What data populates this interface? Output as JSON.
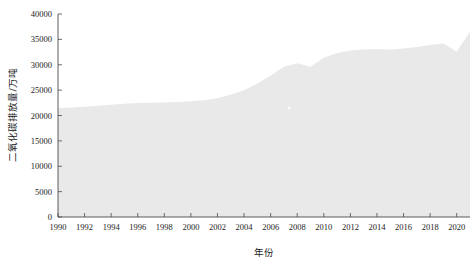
{
  "chart_data": {
    "type": "area",
    "title": "",
    "subtitle": "",
    "xlabel": "年份",
    "ylabel": "二氧化碳排放量/万吨",
    "xlim": [
      1990,
      2021
    ],
    "ylim": [
      0,
      40000
    ],
    "grid": false,
    "legend": null,
    "x_tick_labels": [
      "1990",
      "1992",
      "1994",
      "1996",
      "1998",
      "2000",
      "2002",
      "2004",
      "2006",
      "2008",
      "2010",
      "2012",
      "2014",
      "2016",
      "2018",
      "2020"
    ],
    "x_tick_values": [
      1990,
      1992,
      1994,
      1996,
      1998,
      2000,
      2002,
      2004,
      2006,
      2008,
      2010,
      2012,
      2014,
      2016,
      2018,
      2020
    ],
    "y_tick_labels": [
      "0",
      "5000",
      "10000",
      "15000",
      "20000",
      "25000",
      "30000",
      "35000",
      "40000"
    ],
    "y_tick_values": [
      0,
      5000,
      10000,
      15000,
      20000,
      25000,
      30000,
      35000,
      40000
    ],
    "series": [
      {
        "name": "二氧化碳排放量",
        "color": "#e9e9e9",
        "x": [
          1990,
          1991,
          1992,
          1993,
          1994,
          1995,
          1996,
          1997,
          1998,
          1999,
          2000,
          2001,
          2002,
          2003,
          2004,
          2005,
          2006,
          2007,
          2008,
          2009,
          2010,
          2011,
          2012,
          2013,
          2014,
          2015,
          2016,
          2017,
          2018,
          2019,
          2020,
          2021
        ],
        "values": [
          21500,
          21600,
          21700,
          21900,
          22100,
          22300,
          22450,
          22500,
          22550,
          22650,
          22800,
          23000,
          23400,
          24100,
          25000,
          26300,
          27900,
          29600,
          30300,
          29600,
          31400,
          32300,
          32800,
          33000,
          33100,
          33000,
          33200,
          33500,
          33900,
          34200,
          32600,
          36500
        ]
      }
    ]
  },
  "axes": {
    "x_axis_name": "年份",
    "y_axis_name": "二氧化碳排放量/万吨"
  }
}
